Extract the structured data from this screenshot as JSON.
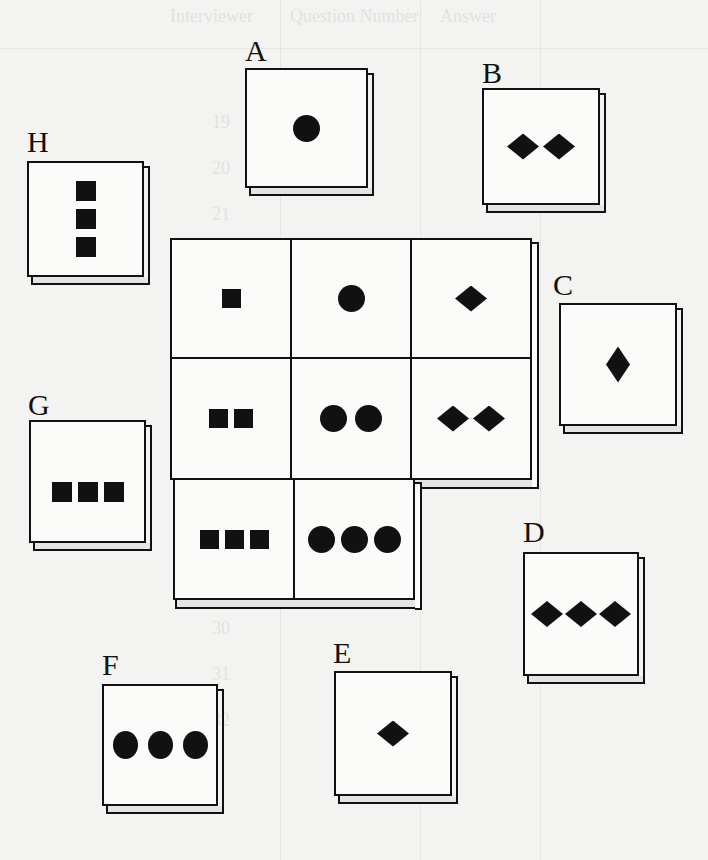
{
  "figure": {
    "type": "matrix-reasoning-puzzle",
    "background_bleedthrough": {
      "headers": [
        "Interviewer",
        "Question Number",
        "Answer"
      ],
      "numbers": [
        "19",
        "20",
        "21",
        "22",
        "23",
        "24",
        "25",
        "26",
        "27",
        "28",
        "29",
        "30",
        "31",
        "32"
      ]
    },
    "matrix": {
      "rows": [
        [
          {
            "shape": "square",
            "count": 1
          },
          {
            "shape": "circle",
            "count": 1
          },
          {
            "shape": "diamond",
            "count": 1
          }
        ],
        [
          {
            "shape": "square",
            "count": 2
          },
          {
            "shape": "circle",
            "count": 2
          },
          {
            "shape": "diamond",
            "count": 2
          }
        ],
        [
          {
            "shape": "square",
            "count": 3
          },
          {
            "shape": "circle",
            "count": 3
          },
          {
            "shape": "missing",
            "count": 0
          }
        ]
      ]
    },
    "options": [
      {
        "label": "A",
        "shape": "circle",
        "count": 1,
        "arrangement": "single"
      },
      {
        "label": "B",
        "shape": "diamond",
        "count": 2,
        "arrangement": "horizontal"
      },
      {
        "label": "C",
        "shape": "diamond",
        "count": 1,
        "arrangement": "single-vertical"
      },
      {
        "label": "D",
        "shape": "diamond",
        "count": 3,
        "arrangement": "horizontal"
      },
      {
        "label": "E",
        "shape": "diamond",
        "count": 1,
        "arrangement": "single"
      },
      {
        "label": "F",
        "shape": "circle",
        "count": 3,
        "arrangement": "horizontal"
      },
      {
        "label": "G",
        "shape": "square",
        "count": 3,
        "arrangement": "horizontal"
      },
      {
        "label": "H",
        "shape": "square",
        "count": 3,
        "arrangement": "vertical"
      }
    ],
    "colors": {
      "ink": "#111111",
      "paper": "#f3f3f1",
      "tile_face": "#fbfbfa",
      "tile_edge": "#e4e4e2"
    }
  }
}
